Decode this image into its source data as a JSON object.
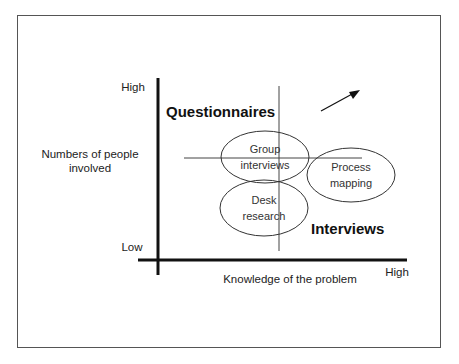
{
  "diagram": {
    "y_axis": {
      "title_line1": "Numbers of people",
      "title_line2": "involved",
      "high": "High",
      "low": "Low"
    },
    "x_axis": {
      "title": "Knowledge of the problem",
      "high": "High"
    },
    "quadrant_labels": {
      "top_left": "Questionnaires",
      "bottom_right": "Interviews"
    },
    "ellipses": [
      {
        "line1": "Group",
        "line2": "interviews"
      },
      {
        "line1": "Desk",
        "line2": "research"
      },
      {
        "line1": "Process",
        "line2": "mapping"
      }
    ],
    "arrow": "diagonal-up-right-arrow",
    "colors": {
      "line": "#111111",
      "thin_line": "#444444",
      "frame": "#555555"
    }
  }
}
